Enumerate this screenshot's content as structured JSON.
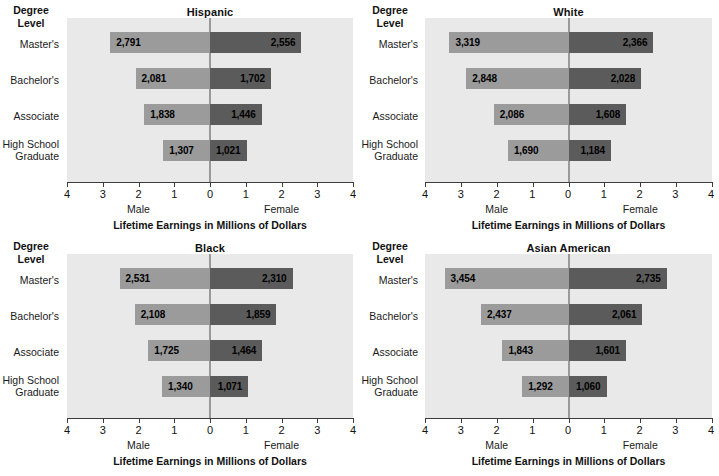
{
  "figure": {
    "axis_column_header": "Degree\nLevel",
    "x_axis_title": "Lifetime Earnings in Millions of Dollars",
    "male_label": "Male",
    "female_label": "Female",
    "degree_levels": [
      "Master's",
      "Bachelor's",
      "Associate",
      "High School\nGraduate"
    ],
    "x_tick_labels": [
      "4",
      "3",
      "2",
      "1",
      "0",
      "1",
      "2",
      "3",
      "4"
    ],
    "colors": {
      "male_bar": "#9b9b9b",
      "female_bar": "#5b5b5b",
      "plot_background": "#e9e9e9",
      "zero_line": "#4a4a4a",
      "axis_line": "#3c3c3c",
      "text": "#111111"
    }
  },
  "chart_data": [
    {
      "type": "bar",
      "title": "Hispanic",
      "xlabel": "Lifetime Earnings in Millions of Dollars",
      "ylabel": "Degree Level",
      "orientation": "horizontal-diverging",
      "xlim": [
        -4,
        4
      ],
      "xticks": [
        -4,
        -3,
        -2,
        -1,
        0,
        1,
        2,
        3,
        4
      ],
      "xticklabels": [
        "4",
        "3",
        "2",
        "1",
        "0",
        "1",
        "2",
        "3",
        "4"
      ],
      "grid": false,
      "legend": "none",
      "units": "millions of dollars",
      "categories": [
        "Master's",
        "Bachelor's",
        "Associate",
        "High School Graduate"
      ],
      "series": [
        {
          "name": "Male",
          "direction": "left",
          "values": [
            2791,
            2081,
            1838,
            1307
          ],
          "labels": [
            "2,791",
            "2,081",
            "1,838",
            "1,307"
          ]
        },
        {
          "name": "Female",
          "direction": "right",
          "values": [
            2556,
            1702,
            1446,
            1021
          ],
          "labels": [
            "2,556",
            "1,702",
            "1,446",
            "1,021"
          ]
        }
      ]
    },
    {
      "type": "bar",
      "title": "White",
      "xlabel": "Lifetime Earnings in Millions of Dollars",
      "ylabel": "Degree Level",
      "orientation": "horizontal-diverging",
      "xlim": [
        -4,
        4
      ],
      "xticks": [
        -4,
        -3,
        -2,
        -1,
        0,
        1,
        2,
        3,
        4
      ],
      "xticklabels": [
        "4",
        "3",
        "2",
        "1",
        "0",
        "1",
        "2",
        "3",
        "4"
      ],
      "grid": false,
      "legend": "none",
      "units": "millions of dollars",
      "categories": [
        "Master's",
        "Bachelor's",
        "Associate",
        "High School Graduate"
      ],
      "series": [
        {
          "name": "Male",
          "direction": "left",
          "values": [
            3319,
            2848,
            2086,
            1690
          ],
          "labels": [
            "3,319",
            "2,848",
            "2,086",
            "1,690"
          ]
        },
        {
          "name": "Female",
          "direction": "right",
          "values": [
            2366,
            2028,
            1608,
            1184
          ],
          "labels": [
            "2,366",
            "2,028",
            "1,608",
            "1,184"
          ]
        }
      ]
    },
    {
      "type": "bar",
      "title": "Black",
      "xlabel": "Lifetime Earnings in Millions of Dollars",
      "ylabel": "Degree Level",
      "orientation": "horizontal-diverging",
      "xlim": [
        -4,
        4
      ],
      "xticks": [
        -4,
        -3,
        -2,
        -1,
        0,
        1,
        2,
        3,
        4
      ],
      "xticklabels": [
        "4",
        "3",
        "2",
        "1",
        "0",
        "1",
        "2",
        "3",
        "4"
      ],
      "grid": false,
      "legend": "none",
      "units": "millions of dollars",
      "categories": [
        "Master's",
        "Bachelor's",
        "Associate",
        "High School Graduate"
      ],
      "series": [
        {
          "name": "Male",
          "direction": "left",
          "values": [
            2531,
            2108,
            1725,
            1340
          ],
          "labels": [
            "2,531",
            "2,108",
            "1,725",
            "1,340"
          ]
        },
        {
          "name": "Female",
          "direction": "right",
          "values": [
            2310,
            1859,
            1464,
            1071
          ],
          "labels": [
            "2,310",
            "1,859",
            "1,464",
            "1,071"
          ]
        }
      ]
    },
    {
      "type": "bar",
      "title": "Asian American",
      "xlabel": "Lifetime Earnings in Millions of Dollars",
      "ylabel": "Degree Level",
      "orientation": "horizontal-diverging",
      "xlim": [
        -4,
        4
      ],
      "xticks": [
        -4,
        -3,
        -2,
        -1,
        0,
        1,
        2,
        3,
        4
      ],
      "xticklabels": [
        "4",
        "3",
        "2",
        "1",
        "0",
        "1",
        "2",
        "3",
        "4"
      ],
      "grid": false,
      "legend": "none",
      "units": "millions of dollars",
      "categories": [
        "Master's",
        "Bachelor's",
        "Associate",
        "High School Graduate"
      ],
      "series": [
        {
          "name": "Male",
          "direction": "left",
          "values": [
            3454,
            2437,
            1843,
            1292
          ],
          "labels": [
            "3,454",
            "2,437",
            "1,843",
            "1,292"
          ]
        },
        {
          "name": "Female",
          "direction": "right",
          "values": [
            2735,
            2061,
            1601,
            1060
          ],
          "labels": [
            "2,735",
            "2,061",
            "1,601",
            "1,060"
          ]
        }
      ]
    }
  ]
}
